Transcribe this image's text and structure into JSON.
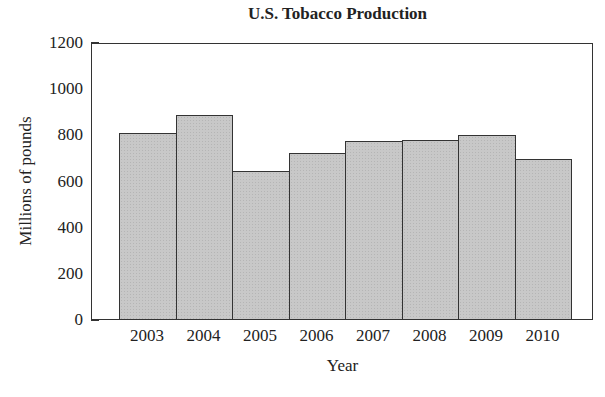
{
  "chart_data": {
    "type": "bar",
    "title": "U.S. Tobacco Production",
    "xlabel": "Year",
    "ylabel": "Millions of pounds",
    "categories": [
      "2003",
      "2004",
      "2005",
      "2006",
      "2007",
      "2008",
      "2009",
      "2010"
    ],
    "values": [
      810,
      890,
      645,
      725,
      775,
      783,
      805,
      697
    ],
    "ylim": [
      0,
      1200
    ],
    "yticks": [
      0,
      200,
      400,
      600,
      800,
      1000,
      1200
    ],
    "grid": false,
    "legend": null,
    "bar_color": "#c8c8c8"
  }
}
